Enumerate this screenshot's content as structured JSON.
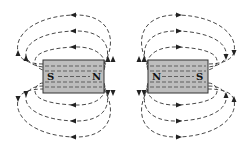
{
  "diagram": {
    "magnets": [
      {
        "id": "left",
        "left_pole": "S",
        "right_pole": "N"
      },
      {
        "id": "right",
        "left_pole": "N",
        "right_pole": "S"
      }
    ],
    "colors": {
      "magnet_fill": "#bdbdbd",
      "line": "#333333",
      "background": "#ffffff"
    }
  }
}
